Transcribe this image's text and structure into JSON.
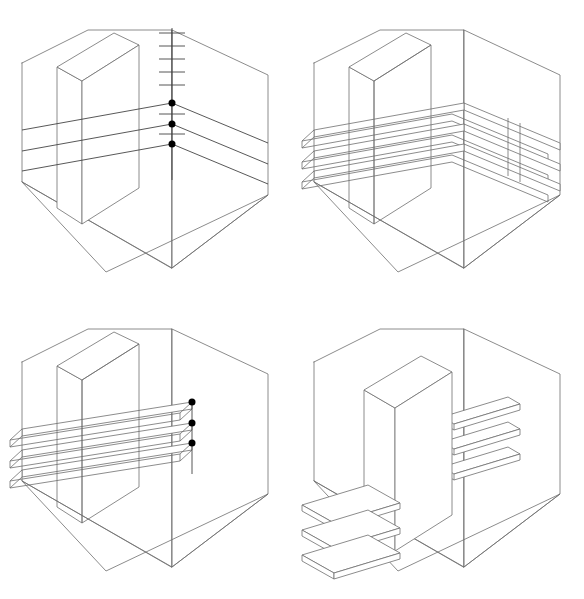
{
  "figure": {
    "panel_count": 4,
    "line_color": "#6f6f6f",
    "accent_color": "#000000",
    "background_color": "#ffffff"
  },
  "panels": [
    {
      "id": "panel-1",
      "step_label": "1",
      "caption": "Set heights on vertical ruler",
      "has_ruler": true,
      "ruler_tick_count": 6,
      "marker_count": 3,
      "marker_position": "wall-corner",
      "shelf_count": 3,
      "shelf_style": "single-line",
      "column_position": "back-left"
    },
    {
      "id": "panel-2",
      "step_label": "2",
      "caption": "Extrude shelf lines into slabs",
      "has_ruler": false,
      "ruler_tick_count": 0,
      "marker_count": 0,
      "marker_position": "none",
      "shelf_count": 3,
      "shelf_style": "thin-slab",
      "column_position": "back-left"
    },
    {
      "id": "panel-3",
      "step_label": "3",
      "caption": "Mark shelf ends at right wall",
      "has_ruler": false,
      "ruler_tick_count": 0,
      "marker_count": 3,
      "marker_position": "shelf-end",
      "shelf_count": 3,
      "shelf_style": "thin-slab",
      "column_position": "back-left"
    },
    {
      "id": "panel-4",
      "step_label": "4",
      "caption": "Partition advanced, shelves split left and right",
      "has_ruler": false,
      "ruler_tick_count": 0,
      "marker_count": 0,
      "marker_position": "none",
      "shelf_count": 3,
      "shelf_style": "split-slab",
      "column_position": "front-centre"
    }
  ],
  "chart_data": {
    "type": "diagram",
    "projection": "isometric-axonometric",
    "shelf_heights_px": [
      103,
      124,
      144
    ],
    "ruler_tick_spacing_px": 13,
    "marker_radius_px": 3.5,
    "dot_color": "#000000"
  }
}
